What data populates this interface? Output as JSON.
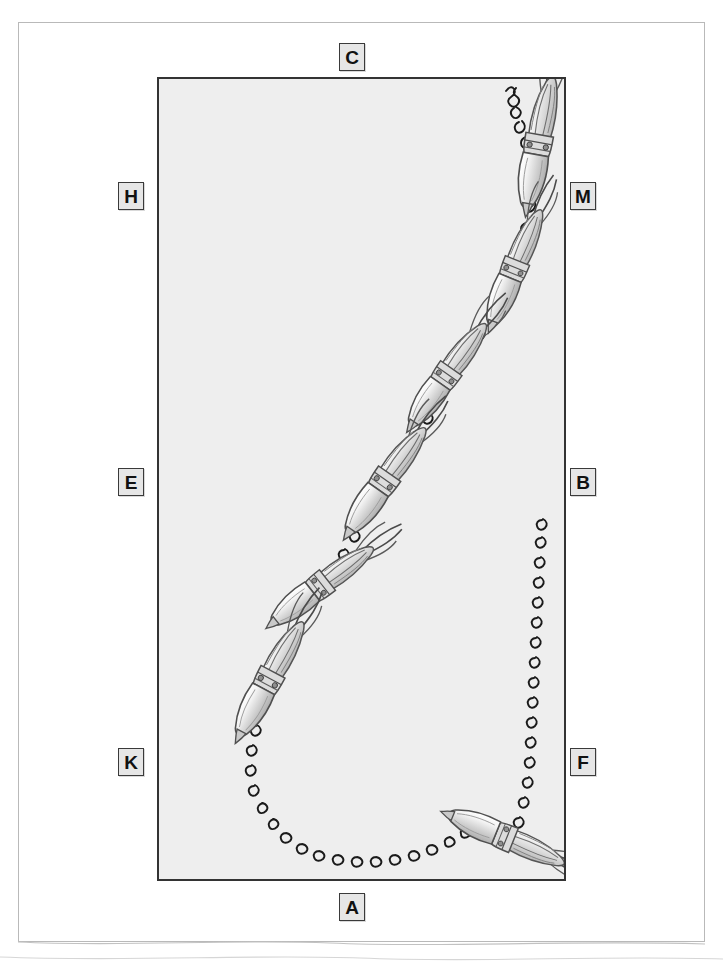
{
  "page": {
    "kind": "scanned-figure-page",
    "background_color": "#ffffff",
    "sheet_border_color": "#b9b9b9"
  },
  "panel": {
    "fill_color": "#eeeeee",
    "border_color": "#333333",
    "description": "Rectangular illustration panel containing a squid migration path"
  },
  "labels": [
    {
      "id": "label-c",
      "text": "C",
      "position": "top-center",
      "x": 339,
      "y": 43
    },
    {
      "id": "label-h",
      "text": "H",
      "position": "left-upper",
      "x": 118,
      "y": 182
    },
    {
      "id": "label-e",
      "text": "E",
      "position": "left-middle",
      "x": 118,
      "y": 468
    },
    {
      "id": "label-k",
      "text": "K",
      "position": "left-lower",
      "x": 118,
      "y": 748
    },
    {
      "id": "label-m",
      "text": "M",
      "position": "right-upper",
      "x": 570,
      "y": 182
    },
    {
      "id": "label-b",
      "text": "B",
      "position": "right-middle",
      "x": 570,
      "y": 468
    },
    {
      "id": "label-f",
      "text": "F",
      "position": "right-lower",
      "x": 570,
      "y": 748
    },
    {
      "id": "label-a",
      "text": "A",
      "position": "bottom-center",
      "x": 339,
      "y": 893
    }
  ],
  "artwork": {
    "path_color": "#1a1a1a",
    "creature_name": "squid",
    "creature_count": 7,
    "path_description": "Wavy squiggled line entering at top right, descending diagonally to lower left, curving in a U along the bottom, then rising as a separate wavy branch on the right side",
    "creatures": [
      {
        "label": "squid-1",
        "x": 535,
        "y": 148,
        "rotation": 10,
        "scale": 1.0
      },
      {
        "label": "squid-2",
        "x": 510,
        "y": 272,
        "rotation": 22,
        "scale": 0.95
      },
      {
        "label": "squid-3",
        "x": 441,
        "y": 378,
        "rotation": 35,
        "scale": 0.95
      },
      {
        "label": "squid-4",
        "x": 379,
        "y": 484,
        "rotation": 35,
        "scale": 1.0
      },
      {
        "label": "squid-5",
        "x": 314,
        "y": 587,
        "rotation": 52,
        "scale": 0.95
      },
      {
        "label": "squid-6",
        "x": 264,
        "y": 683,
        "rotation": 28,
        "scale": 1.0
      },
      {
        "label": "squid-7",
        "x": 498,
        "y": 833,
        "rotation": 112,
        "scale": 0.95
      }
    ]
  }
}
